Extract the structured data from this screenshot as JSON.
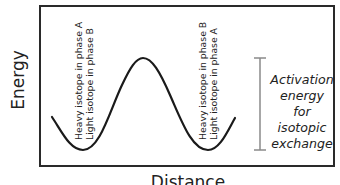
{
  "axes": {
    "y_label": "Energy",
    "x_label": "Distance"
  },
  "left_well": {
    "line1": "Heavy isotope in phase A",
    "line2": "Light isotope in phase B"
  },
  "right_well": {
    "line1": "Heavy isotope in phase B",
    "line2": "Light isotope in phase A"
  },
  "activation": {
    "line1": "Activation",
    "line2": "energy for",
    "line3": "isotopic",
    "line4": "exchange",
    "bar_color": "#8a8a8a"
  },
  "colors": {
    "curve": "#1a1a1a",
    "frame": "#2a2a2a"
  }
}
